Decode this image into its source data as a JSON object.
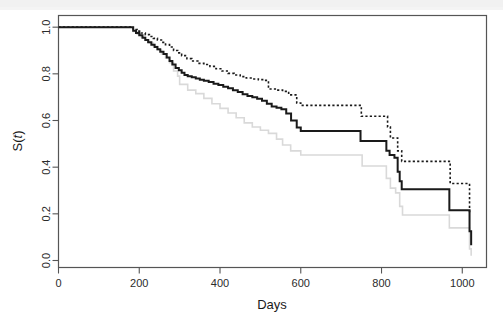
{
  "figure": {
    "kind": "kaplan-meier-survival-plot",
    "background_color": "#ffffff",
    "frame_color": "#555555"
  },
  "axes": {
    "x_title": "Days",
    "y_title_main": "S(",
    "y_title_italic": "t",
    "y_title_close": ")",
    "y_title_full": "S(t)",
    "x_ticks": [
      "0",
      "200",
      "400",
      "600",
      "800",
      "1000"
    ],
    "y_ticks": [
      "0.0",
      "0.2",
      "0.4",
      "0.6",
      "0.8",
      "1.0"
    ]
  },
  "chart_data": {
    "type": "line",
    "title": "",
    "subtitle": "",
    "xlabel": "Days",
    "ylabel": "S(t)",
    "xlim": [
      0,
      1060
    ],
    "ylim": [
      -0.03,
      1.05
    ],
    "grid": false,
    "legend": "none",
    "annotations": [],
    "style_note": "Kaplan-Meier step function with pointwise 95% confidence limits; step interpolation (post).",
    "series": [
      {
        "name": "Survival estimate",
        "role": "estimate",
        "color": "#1a1a1a",
        "dash": "solid",
        "width": 2.0,
        "x": [
          0,
          95,
          120,
          175,
          185,
          192,
          200,
          208,
          215,
          222,
          230,
          238,
          245,
          252,
          260,
          268,
          275,
          282,
          290,
          298,
          305,
          312,
          320,
          330,
          340,
          350,
          360,
          372,
          384,
          396,
          408,
          420,
          432,
          444,
          456,
          468,
          480,
          492,
          504,
          516,
          528,
          540,
          552,
          564,
          576,
          590,
          600,
          745,
          748,
          805,
          812,
          820,
          832,
          840,
          845,
          850,
          960,
          968,
          1012,
          1018,
          1022
        ],
        "y": [
          1.0,
          1.0,
          1.0,
          1.0,
          0.985,
          0.975,
          0.965,
          0.955,
          0.945,
          0.935,
          0.925,
          0.915,
          0.905,
          0.895,
          0.885,
          0.87,
          0.855,
          0.84,
          0.825,
          0.815,
          0.805,
          0.795,
          0.79,
          0.785,
          0.78,
          0.775,
          0.77,
          0.765,
          0.758,
          0.752,
          0.745,
          0.738,
          0.73,
          0.722,
          0.712,
          0.705,
          0.7,
          0.693,
          0.685,
          0.672,
          0.66,
          0.655,
          0.648,
          0.63,
          0.6,
          0.57,
          0.555,
          0.555,
          0.512,
          0.512,
          0.47,
          0.452,
          0.44,
          0.38,
          0.34,
          0.305,
          0.305,
          0.215,
          0.215,
          0.125,
          0.065
        ]
      },
      {
        "name": "Upper 95% confidence limit",
        "role": "upper-ci",
        "color": "#1a1a1a",
        "dash": "dotted",
        "width": 1.6,
        "x": [
          0,
          95,
          120,
          175,
          185,
          195,
          205,
          215,
          225,
          235,
          245,
          255,
          265,
          275,
          285,
          295,
          305,
          318,
          330,
          345,
          360,
          375,
          390,
          405,
          420,
          435,
          450,
          465,
          480,
          495,
          510,
          520,
          540,
          555,
          570,
          590,
          600,
          745,
          750,
          808,
          815,
          822,
          840,
          850,
          962,
          970,
          1012,
          1018,
          1022
        ],
        "y": [
          1.0,
          1.0,
          1.0,
          1.0,
          0.99,
          0.983,
          0.975,
          0.968,
          0.96,
          0.952,
          0.945,
          0.935,
          0.925,
          0.915,
          0.9,
          0.89,
          0.878,
          0.865,
          0.855,
          0.845,
          0.84,
          0.832,
          0.822,
          0.812,
          0.802,
          0.795,
          0.788,
          0.782,
          0.778,
          0.775,
          0.772,
          0.735,
          0.73,
          0.725,
          0.71,
          0.675,
          0.665,
          0.665,
          0.618,
          0.618,
          0.572,
          0.525,
          0.47,
          0.425,
          0.425,
          0.33,
          0.33,
          0.21,
          0.205
        ]
      },
      {
        "name": "Lower 95% confidence limit",
        "role": "lower-ci",
        "color": "#d9d9d9",
        "dash": "solid",
        "width": 1.6,
        "x": [
          0,
          95,
          120,
          175,
          185,
          195,
          205,
          215,
          225,
          235,
          245,
          255,
          265,
          275,
          285,
          295,
          300,
          320,
          340,
          360,
          380,
          400,
          420,
          440,
          460,
          480,
          500,
          520,
          540,
          555,
          575,
          600,
          745,
          752,
          805,
          812,
          822,
          835,
          845,
          852,
          960,
          968,
          1012,
          1018,
          1022
        ],
        "y": [
          1.0,
          1.0,
          1.0,
          1.0,
          0.982,
          0.97,
          0.958,
          0.945,
          0.932,
          0.918,
          0.902,
          0.885,
          0.868,
          0.848,
          0.812,
          0.79,
          0.755,
          0.73,
          0.715,
          0.695,
          0.672,
          0.652,
          0.632,
          0.612,
          0.59,
          0.572,
          0.558,
          0.545,
          0.52,
          0.495,
          0.47,
          0.452,
          0.452,
          0.405,
          0.405,
          0.352,
          0.31,
          0.29,
          0.232,
          0.195,
          0.195,
          0.14,
          0.14,
          0.05,
          0.02
        ]
      }
    ]
  }
}
